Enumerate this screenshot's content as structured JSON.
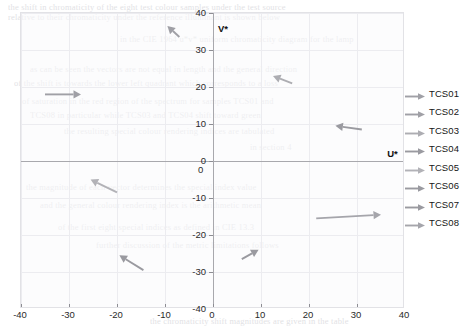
{
  "figure": {
    "title": "",
    "background_color": "#ffffff",
    "panel_color": "#fafafb",
    "panel_border_color": "#e2e2e6",
    "grid_color": "#ececf0",
    "axis_color": "#a8a8ad",
    "vector_color": "#9a9aa0"
  },
  "axes": {
    "x_title": "U*",
    "y_title": "V*",
    "x_ticks": [
      "-40",
      "-30",
      "-20",
      "-10",
      "0",
      "10",
      "20",
      "30",
      "40"
    ],
    "y_ticks": [
      "40",
      "30",
      "20",
      "10",
      "0",
      "-10",
      "-20",
      "-30",
      "-40"
    ],
    "origin_x_label": "0",
    "origin_y_label": "0"
  },
  "legend": {
    "items": [
      {
        "label": "TCS01",
        "marker": "arrow-right-icon",
        "color": "#a0a0a6"
      },
      {
        "label": "TCS02",
        "marker": "arrow-right-icon",
        "color": "#a0a0a6"
      },
      {
        "label": "TCS03",
        "marker": "arrow-right-icon",
        "color": "#adadb2"
      },
      {
        "label": "TCS04",
        "marker": "arrow-right-icon",
        "color": "#9a9aa0"
      },
      {
        "label": "TCS05",
        "marker": "arrow-right-icon",
        "color": "#b2b2b7"
      },
      {
        "label": "TCS06",
        "marker": "arrow-right-icon",
        "color": "#9a9aa0"
      },
      {
        "label": "TCS07",
        "marker": "arrow-right-icon",
        "color": "#9a9aa0"
      },
      {
        "label": "TCS08",
        "marker": "arrow-right-icon",
        "color": "#a5a5ab"
      }
    ]
  },
  "page_bleed": {
    "lines": [
      {
        "text": "the shift in chromaticity of the eight test colour samples under the test source",
        "x": 8,
        "y": 2
      },
      {
        "text": "relative to their chromaticity under the reference illuminant is shown below",
        "x": 8,
        "y": 12
      },
      {
        "text": "in the CIE 1964 u*v* uniform chromaticity diagram for the lamp",
        "x": 120,
        "y": 34
      },
      {
        "text": "as can be seen the vectors are not equal in length and the general direction",
        "x": 30,
        "y": 64
      },
      {
        "text": "of the shift is towards the lower left quadrant which corresponds to a loss",
        "x": 14,
        "y": 78
      },
      {
        "text": "of saturation in the red region of the spectrum for samples TCS01 and",
        "x": 22,
        "y": 96
      },
      {
        "text": "TCS08 in particular while TCS03 and TCS04 shift toward green",
        "x": 30,
        "y": 110
      },
      {
        "text": "the resulting special colour rendering indices are tabulated",
        "x": 64,
        "y": 126
      },
      {
        "text": "in section 4",
        "x": 250,
        "y": 142
      },
      {
        "text": "the magnitude of each vector determines the special index value",
        "x": 26,
        "y": 182
      },
      {
        "text": "and the general colour rendering index is the arithmetic mean",
        "x": 40,
        "y": 200
      },
      {
        "text": "of the first eight special indices as defined in CIE 13.3",
        "x": 58,
        "y": 222
      },
      {
        "text": "further discussion of the metric limitations follows",
        "x": 96,
        "y": 240
      },
      {
        "text": "the chromaticity shift magnitudes are given in the table",
        "x": 150,
        "y": 316
      }
    ]
  },
  "chart_data": {
    "type": "quiver",
    "xlabel": "U*",
    "ylabel": "V*",
    "xlim": [
      -40,
      40
    ],
    "ylim": [
      -40,
      40
    ],
    "xticks": [
      -40,
      -30,
      -20,
      -10,
      0,
      10,
      20,
      30,
      40
    ],
    "yticks": [
      -40,
      -30,
      -20,
      -10,
      0,
      10,
      20,
      30,
      40
    ],
    "grid": true,
    "legend_position": "right-outside",
    "series": [
      {
        "name": "TCS01",
        "start": [
          -35.0,
          18.0
        ],
        "end": [
          -27.5,
          18.0
        ],
        "dx": 7.5,
        "dy": 0.0,
        "color": "#a0a0a6"
      },
      {
        "name": "TCS02",
        "start": [
          -7.0,
          33.5
        ],
        "end": [
          -9.5,
          36.5
        ],
        "dx": -2.5,
        "dy": 3.0,
        "color": "#a0a0a6"
      },
      {
        "name": "TCS03",
        "start": [
          16.5,
          21.0
        ],
        "end": [
          12.5,
          23.0
        ],
        "dx": -4.0,
        "dy": 2.0,
        "color": "#adadb2"
      },
      {
        "name": "TCS04",
        "start": [
          31.0,
          8.5
        ],
        "end": [
          25.5,
          9.5
        ],
        "dx": -5.5,
        "dy": 1.0,
        "color": "#9a9aa0"
      },
      {
        "name": "TCS05",
        "start": [
          -20.0,
          -8.5
        ],
        "end": [
          -25.5,
          -5.0
        ],
        "dx": 5.5,
        "dy": -3.5,
        "color": "#b2b2b7"
      },
      {
        "name": "TCS06",
        "start": [
          -14.5,
          -29.5
        ],
        "end": [
          -19.5,
          -25.5
        ],
        "dx": 5.0,
        "dy": -4.0,
        "color": "#9a9aa0"
      },
      {
        "name": "TCS07",
        "start": [
          6.0,
          -26.5
        ],
        "end": [
          9.5,
          -24.0
        ],
        "dx": -3.5,
        "dy": -2.5,
        "color": "#9a9aa0"
      },
      {
        "name": "TCS08",
        "start": [
          21.5,
          -15.5
        ],
        "end": [
          35.0,
          -14.5
        ],
        "dx": -13.5,
        "dy": -1.0,
        "color": "#a5a5ab"
      }
    ]
  }
}
